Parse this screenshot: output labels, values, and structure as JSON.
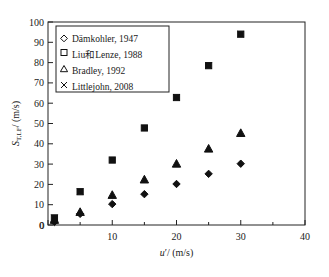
{
  "figure": {
    "top_caption": "",
    "bottom_caption": ""
  },
  "chart_data": {
    "type": "scatter",
    "title": "",
    "xlabel": "u'/ (m/s)",
    "ylabel": "S_T,LF/ (m/s)",
    "xlim": [
      0,
      40
    ],
    "ylim": [
      0,
      100
    ],
    "xticks": [
      0,
      10,
      20,
      30,
      40
    ],
    "xticklabels": [
      "0",
      "10",
      "20",
      "30",
      "40"
    ],
    "xminorticks": [
      5,
      15,
      25,
      35
    ],
    "yticks": [
      0,
      10,
      20,
      30,
      40,
      50,
      60,
      70,
      80,
      90,
      100
    ],
    "yticklabels": [
      "0",
      "10",
      "20",
      "30",
      "40",
      "50",
      "60",
      "70",
      "80",
      "90",
      "100"
    ],
    "grid": false,
    "legend_position": "upper left",
    "series": [
      {
        "name": "Dämkohler, 1947",
        "marker": "diamond",
        "fill": "filled",
        "x": [
          1,
          5,
          10,
          15,
          20,
          25,
          30
        ],
        "y": [
          1.5,
          5.5,
          10.3,
          15.2,
          20.2,
          25.2,
          30.2
        ]
      },
      {
        "name": "Liu和Lenze, 1988",
        "marker": "square",
        "fill": "filled",
        "x": [
          1,
          5,
          10,
          15,
          20,
          25,
          30
        ],
        "y": [
          3.5,
          16.4,
          32.0,
          47.8,
          62.8,
          78.5,
          94.0
        ]
      },
      {
        "name": "Bradley, 1992",
        "marker": "triangle",
        "fill": "filled",
        "x": [
          1,
          5,
          10,
          15,
          20,
          25,
          30
        ],
        "y": [
          2.5,
          6.4,
          14.8,
          22.4,
          30.2,
          37.6,
          45.3
        ]
      },
      {
        "name": "Littlejohn, 2008",
        "marker": "cross",
        "fill": "open",
        "x": [
          1,
          5,
          20,
          25,
          30
        ],
        "y": [
          3.5,
          16.4,
          62.8,
          78.5,
          94.0
        ]
      }
    ]
  },
  "legend": {
    "entries": [
      {
        "label": "Dämkohler, 1947",
        "marker": "diamond-open-icon"
      },
      {
        "label": "Liu和Lenze, 1988",
        "marker": "square-open-icon"
      },
      {
        "label": "Bradley, 1992",
        "marker": "triangle-open-icon"
      },
      {
        "label": "Littlejohn, 2008",
        "marker": "cross-icon"
      }
    ]
  }
}
